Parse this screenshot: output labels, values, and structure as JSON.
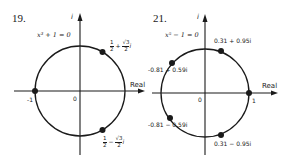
{
  "figures": [
    {
      "id": "19",
      "number_label": "19.",
      "equation": "x³ + 1 = 0",
      "imag_axis_label": "i",
      "real_axis_label": "Real",
      "origin_label": "0",
      "tick_label": "-1",
      "roots": [
        {
          "label_re_num": "1",
          "label_re_den": "2",
          "sign": "+",
          "label_im_num": "√3",
          "label_im_den": "2",
          "unit": "i",
          "angle_deg": 60
        },
        {
          "label": "-1",
          "angle_deg": 180
        },
        {
          "label_re_num": "1",
          "label_re_den": "2",
          "sign": "−",
          "label_im_num": "√3",
          "label_im_den": "2",
          "unit": "i",
          "angle_deg": -60
        }
      ]
    },
    {
      "id": "21",
      "number_label": "21.",
      "equation": "x⁵ − 1 = 0",
      "imag_axis_label": "i",
      "real_axis_label": "Real",
      "origin_label": "0",
      "tick_label": "1",
      "roots": [
        {
          "label": "0.31 + 0.95i",
          "angle_deg": 72
        },
        {
          "label": "-0.81 + 0.59i",
          "angle_deg": 144
        },
        {
          "label": "1",
          "angle_deg": 0
        },
        {
          "label": "-0.81 − 0.59i",
          "angle_deg": 216
        },
        {
          "label": "0.31 − 0.95i",
          "angle_deg": 288
        }
      ]
    }
  ],
  "colors": {
    "ink": "#1a1a1a",
    "background": "#ffffff"
  }
}
